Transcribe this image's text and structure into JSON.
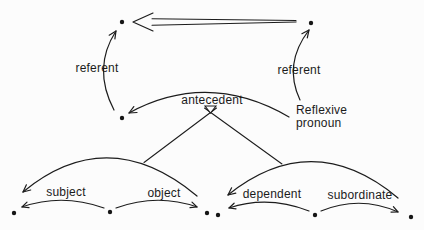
{
  "diagram": {
    "colors": {
      "ink": "#1c1c1c",
      "background": "#fcfcfc"
    },
    "labels": {
      "referent_left": "referent",
      "referent_right": "referent",
      "antecedent": "antecedent",
      "reflexive_line1": "Reflexive",
      "reflexive_line2": "pronoun",
      "subject": "subject",
      "object": "object",
      "dependent": "dependent",
      "subordinate": "subordinate"
    }
  }
}
